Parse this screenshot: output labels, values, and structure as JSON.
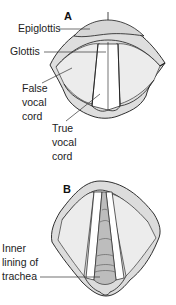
{
  "figure": {
    "panels": [
      {
        "id": "A",
        "label": "A",
        "callouts": [
          {
            "text": "Epiglottis"
          },
          {
            "text": "Glottis"
          },
          {
            "lines": [
              "False",
              "vocal",
              "cord"
            ]
          },
          {
            "lines": [
              "True",
              "vocal",
              "cord"
            ]
          }
        ]
      },
      {
        "id": "B",
        "label": "B",
        "callouts": [
          {
            "lines": [
              "Inner",
              "lining of",
              "trachea"
            ]
          }
        ]
      }
    ]
  },
  "colors": {
    "tissue_fill": "#dcdcdc",
    "light_fill": "#ececec",
    "trachea_fill": "#bdbdbd",
    "outline": "#1a1a1a",
    "leader_line": "#333333"
  }
}
